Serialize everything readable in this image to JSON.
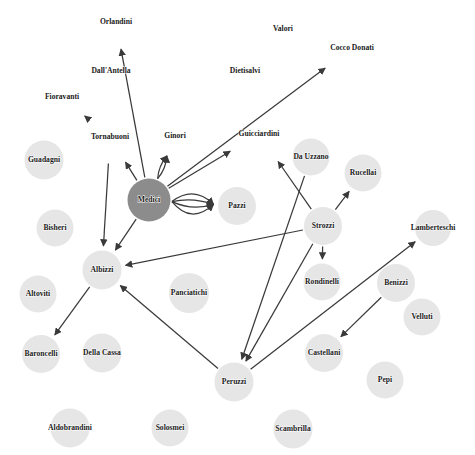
{
  "figure": {
    "width": 475,
    "height": 455,
    "background_color": "#ffffff"
  },
  "style": {
    "node_fill": "#e6e6e6",
    "highlight_fill": "#8c8c8c",
    "edge_color": "#3a3a3a",
    "label_color": "#1a1a1a"
  },
  "chart_data": {
    "type": "diagram",
    "layout": "network-graph",
    "directed": true,
    "title": "",
    "highlighted_nodes": [
      "Medici"
    ],
    "nodes": [
      {
        "id": "Orlandini",
        "label": "Orlandini",
        "x": 116,
        "y": 22,
        "r": 0,
        "highlight": false
      },
      {
        "id": "Valori",
        "label": "Valori",
        "x": 283,
        "y": 29,
        "r": 0,
        "highlight": false
      },
      {
        "id": "CoccoDonati",
        "label": "Cocco Donati",
        "x": 352,
        "y": 48,
        "r": 0,
        "highlight": false
      },
      {
        "id": "DallAntella",
        "label": "Dall'Antella",
        "x": 111,
        "y": 71,
        "r": 0,
        "highlight": false
      },
      {
        "id": "Dietisalvi",
        "label": "Dietisalvi",
        "x": 245,
        "y": 71,
        "r": 0,
        "highlight": false
      },
      {
        "id": "Fioravanti",
        "label": "Fioravanti",
        "x": 62,
        "y": 97,
        "r": 0,
        "highlight": false
      },
      {
        "id": "Tornabuoni",
        "label": "Tornabuoni",
        "x": 110,
        "y": 137,
        "r": 0,
        "highlight": false
      },
      {
        "id": "Ginori",
        "label": "Ginori",
        "x": 175,
        "y": 136,
        "r": 0,
        "highlight": false
      },
      {
        "id": "Guicciardini",
        "label": "Guicciardini",
        "x": 259,
        "y": 134,
        "r": 0,
        "highlight": false
      },
      {
        "id": "Guadagni",
        "label": "Guadagni",
        "x": 44,
        "y": 160,
        "r": 19.5,
        "highlight": false
      },
      {
        "id": "DaUzzano",
        "label": "Da Uzzano",
        "x": 311,
        "y": 157,
        "r": 18.5,
        "highlight": false
      },
      {
        "id": "Rucellai",
        "label": "Rucellai",
        "x": 363,
        "y": 173,
        "r": 18.5,
        "highlight": false
      },
      {
        "id": "Medici",
        "label": "Medici",
        "x": 149,
        "y": 200,
        "r": 21.5,
        "highlight": true
      },
      {
        "id": "Pazzi",
        "label": "Pazzi",
        "x": 237,
        "y": 206,
        "r": 19,
        "highlight": false
      },
      {
        "id": "Strozzi",
        "label": "Strozzi",
        "x": 323,
        "y": 226,
        "r": 19,
        "highlight": false
      },
      {
        "id": "Bisheri",
        "label": "Bisheri",
        "x": 55,
        "y": 228,
        "r": 18.5,
        "highlight": false
      },
      {
        "id": "Lamberteschi",
        "label": "Lamberteschi",
        "x": 433,
        "y": 228,
        "r": 18,
        "highlight": false
      },
      {
        "id": "Albizzi",
        "label": "Albizzi",
        "x": 102,
        "y": 270,
        "r": 19.5,
        "highlight": false
      },
      {
        "id": "Rondinelli",
        "label": "Rondinelli",
        "x": 322,
        "y": 282,
        "r": 18.5,
        "highlight": false
      },
      {
        "id": "Benizzi",
        "label": "Benizzi",
        "x": 396,
        "y": 283,
        "r": 19,
        "highlight": false
      },
      {
        "id": "Altoviti",
        "label": "Altoviti",
        "x": 38,
        "y": 294,
        "r": 18.5,
        "highlight": false
      },
      {
        "id": "Panciatichi",
        "label": "Panciatichi",
        "x": 189,
        "y": 293,
        "r": 20,
        "highlight": false
      },
      {
        "id": "Velluti",
        "label": "Velluti",
        "x": 422,
        "y": 317,
        "r": 18.5,
        "highlight": false
      },
      {
        "id": "Baroncelli",
        "label": "Baroncelli",
        "x": 41,
        "y": 354,
        "r": 19,
        "highlight": false
      },
      {
        "id": "DellaCassa",
        "label": "Della Cassa",
        "x": 102,
        "y": 353,
        "r": 19.5,
        "highlight": false
      },
      {
        "id": "Castellani",
        "label": "Castellani",
        "x": 324,
        "y": 353,
        "r": 19,
        "highlight": false
      },
      {
        "id": "Pepi",
        "label": "Pepi",
        "x": 385,
        "y": 380,
        "r": 18.5,
        "highlight": false
      },
      {
        "id": "Peruzzi",
        "label": "Peruzzi",
        "x": 234,
        "y": 382,
        "r": 19.5,
        "highlight": false
      },
      {
        "id": "Aldobrandini",
        "label": "Aldobrandini",
        "x": 70,
        "y": 428,
        "r": 19.5,
        "highlight": false
      },
      {
        "id": "Solosmei",
        "label": "Solosmei",
        "x": 170,
        "y": 428,
        "r": 18.5,
        "highlight": false
      },
      {
        "id": "Scambrilla",
        "label": "Scambrilla",
        "x": 293,
        "y": 429,
        "r": 19.5,
        "highlight": false
      }
    ],
    "edges": [
      {
        "source": "Medici",
        "target": "Orlandini",
        "curve": 0
      },
      {
        "source": "Tornabuoni",
        "target": "Fioravanti",
        "curve": 0
      },
      {
        "source": "Medici",
        "target": "Tornabuoni",
        "curve": 0
      },
      {
        "source": "Medici",
        "target": "Ginori",
        "curve": 2
      },
      {
        "source": "Medici",
        "target": "Ginori",
        "curve": -2
      },
      {
        "source": "Medici",
        "target": "Guicciardini",
        "curve": 0
      },
      {
        "source": "Medici",
        "target": "CoccoDonati",
        "curve": 0
      },
      {
        "source": "Medici",
        "target": "Pazzi",
        "curve": -9
      },
      {
        "source": "Medici",
        "target": "Pazzi",
        "curve": -3
      },
      {
        "source": "Medici",
        "target": "Pazzi",
        "curve": 4
      },
      {
        "source": "Medici",
        "target": "Pazzi",
        "curve": 11
      },
      {
        "source": "Medici",
        "target": "Albizzi",
        "curve": 0
      },
      {
        "source": "Tornabuoni",
        "target": "Albizzi",
        "curve": 0
      },
      {
        "source": "Strozzi",
        "target": "Albizzi",
        "curve": 0
      },
      {
        "source": "Strozzi",
        "target": "Guicciardini",
        "curve": 0
      },
      {
        "source": "Strozzi",
        "target": "Rucellai",
        "curve": 0
      },
      {
        "source": "Strozzi",
        "target": "Rondinelli",
        "curve": 0
      },
      {
        "source": "Strozzi",
        "target": "Peruzzi",
        "curve": 0
      },
      {
        "source": "DaUzzano",
        "target": "Peruzzi",
        "curve": 0
      },
      {
        "source": "Albizzi",
        "target": "Baroncelli",
        "curve": 0
      },
      {
        "source": "Peruzzi",
        "target": "Albizzi",
        "curve": 0
      },
      {
        "source": "Peruzzi",
        "target": "Lamberteschi",
        "curve": 0
      },
      {
        "source": "Benizzi",
        "target": "Castellani",
        "curve": 0
      }
    ]
  }
}
